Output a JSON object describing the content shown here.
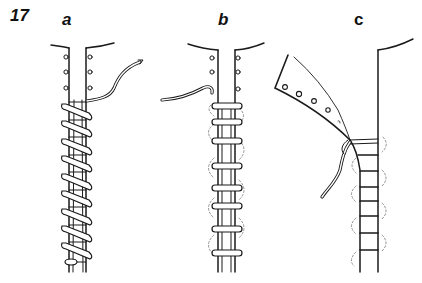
{
  "figure": {
    "number": "17"
  },
  "panels": [
    {
      "label": "a",
      "technique": "diagonal whip/overcast stitch wrapped around the strip",
      "stitch_count": 10,
      "holes_visible": 6
    },
    {
      "label": "b",
      "technique": "straight horizontal wrapping stitches with dashed loops behind",
      "stitch_count": 8,
      "holes_visible": 5
    },
    {
      "label": "c",
      "technique": "flap folded away showing horizontal ladder stitches with dashed loops",
      "stitch_count": 8,
      "holes_visible": 4
    }
  ],
  "colors": {
    "line": "#1a1a1a",
    "thread_fill": "#ffffff",
    "dashed": "#888888",
    "background": "#ffffff"
  }
}
